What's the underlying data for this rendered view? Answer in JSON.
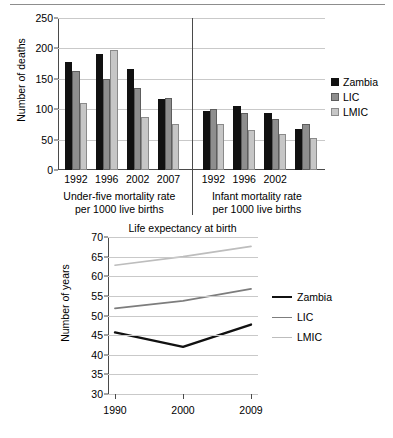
{
  "colors": {
    "zambia": "#111111",
    "lic": "#8e8e8e",
    "lmic": "#c6c6c6",
    "lic_line": "#7d7d7d",
    "lmic_line": "#bdbdbd",
    "axis": "#4a4a4a",
    "grid": "#c9c9c9"
  },
  "chart_data": [
    {
      "type": "bar",
      "title": "",
      "xlabel": "",
      "ylabel": "Number of deaths",
      "ylim": [
        0,
        250
      ],
      "yticks": [
        0,
        50,
        100,
        150,
        200,
        250
      ],
      "grid": true,
      "legend_position": "right",
      "legend": [
        "Zambia",
        "LIC",
        "LMIC"
      ],
      "panels": [
        {
          "caption_line1": "Under-five mortality rate",
          "caption_line2": "per 1000 live births",
          "categories": [
            "1992",
            "1996",
            "2002",
            "2007"
          ],
          "series": [
            {
              "name": "Zambia",
              "values": [
                178,
                190,
                166,
                117
              ]
            },
            {
              "name": "LIC",
              "values": [
                163,
                150,
                135,
                119
              ]
            },
            {
              "name": "LMIC",
              "values": [
                111,
                197,
                88,
                76
              ]
            }
          ]
        },
        {
          "caption_line1": "Infant mortality rate",
          "caption_line2": "per 1000 live births",
          "categories": [
            "1992",
            "1996",
            "2002",
            ""
          ],
          "series": [
            {
              "name": "Zambia",
              "values": [
                97,
                106,
                94,
                68
              ]
            },
            {
              "name": "LIC",
              "values": [
                101,
                93,
                84,
                75
              ]
            },
            {
              "name": "LMIC",
              "values": [
                75,
                66,
                60,
                52
              ]
            }
          ]
        }
      ]
    },
    {
      "type": "line",
      "title": "Life expectancy at birth",
      "xlabel": "",
      "ylabel": "Number of years",
      "x": [
        "1990",
        "2000",
        "2009"
      ],
      "ylim": [
        30,
        70
      ],
      "yticks": [
        30,
        35,
        40,
        45,
        50,
        55,
        60,
        65,
        70
      ],
      "grid": true,
      "legend_position": "right",
      "legend": [
        "Zambia",
        "LIC",
        "LMIC"
      ],
      "series": [
        {
          "name": "Zambia",
          "values": [
            45.7,
            42.0,
            47.7
          ]
        },
        {
          "name": "LIC",
          "values": [
            51.8,
            53.7,
            56.8
          ]
        },
        {
          "name": "LMIC",
          "values": [
            62.8,
            65.0,
            67.6
          ]
        }
      ]
    }
  ]
}
